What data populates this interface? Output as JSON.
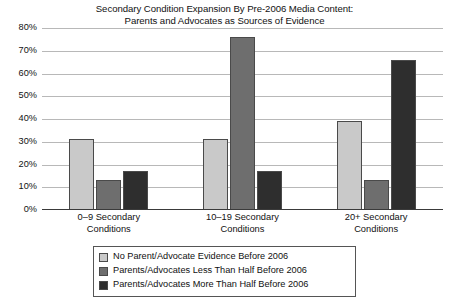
{
  "chart_data": {
    "type": "bar",
    "title": "Secondary Condition Expansion By Pre-2006 Media Content: Parents and Advocates as Sources of Evidence",
    "title_lines": [
      "Secondary Condition Expansion By Pre-2006 Media Content:",
      "Parents and Advocates as Sources of Evidence"
    ],
    "categories": [
      "0–9 Secondary Conditions",
      "10–19 Secondary Conditions",
      "20+ Secondary Conditions"
    ],
    "category_lines": [
      [
        "0–9 Secondary",
        "Conditions"
      ],
      [
        "10–19 Secondary",
        "Conditions"
      ],
      [
        "20+ Secondary",
        "Conditions"
      ]
    ],
    "series": [
      {
        "name": "No Parent/Advocate Evidence Before 2006",
        "color": "#c9c9c9",
        "values": [
          31,
          31,
          39
        ]
      },
      {
        "name": "Parents/Advocates Less Than Half Before 2006",
        "color": "#6e6e6e",
        "values": [
          13,
          76,
          13
        ]
      },
      {
        "name": "Parents/Advocates More Than Half Before 2006",
        "color": "#2e2e2e",
        "values": [
          17,
          17,
          66
        ]
      }
    ],
    "xlabel": "",
    "ylabel": "",
    "ylim": [
      0,
      80
    ],
    "ytick_values": [
      80,
      70,
      60,
      50,
      40,
      30,
      20,
      10,
      0
    ],
    "ytick_labels": [
      "80%",
      "70%",
      "60%",
      "50%",
      "40%",
      "30%",
      "20%",
      "10%",
      "0%"
    ],
    "grid": true,
    "grid_color": "#b8b8b8",
    "legend_position": "bottom-center",
    "background_color": "#ffffff"
  }
}
